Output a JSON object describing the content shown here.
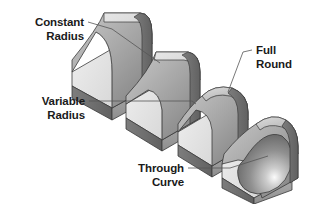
{
  "figure": {
    "background_color": "#ffffff",
    "line_color": "#555555",
    "text_color": "#1a1a1a",
    "shading": {
      "top_face": "#d9d9d9",
      "front_face": "#9c9c9c",
      "side_face": "#6f6f6f",
      "fillet_light": "#c4c4c4",
      "fillet_mid": "#a6a6a6",
      "fillet_dark": "#7c7c7c",
      "outline": "#3a3a3a",
      "highlight": "#f2f2f2"
    }
  },
  "callouts": [
    {
      "id": "constant-radius",
      "line1": "Constant",
      "line2": "Radius",
      "align": "right",
      "text_x": 84,
      "text_y1": 26,
      "text_y2": 40,
      "leader": "M 88 22 L 112 29 L 160 63"
    },
    {
      "id": "variable-radius",
      "line1": "Variable",
      "line2": "Radius",
      "align": "right",
      "text_x": 85,
      "text_y1": 105,
      "text_y2": 119,
      "leader": "M 89 101 L 192 101 L 196 104"
    },
    {
      "id": "full-round",
      "line1": "Full",
      "line2": "Round",
      "align": "left",
      "text_x": 256,
      "text_y1": 54,
      "text_y2": 68,
      "leader": "M 252 50 L 243 52 L 228 92"
    },
    {
      "id": "through-curve",
      "line1": "Through",
      "line2": "Curve",
      "align": "right",
      "text_x": 184,
      "text_y1": 172,
      "text_y2": 186,
      "leader": "M 188 168 L 230 168 L 268 156"
    }
  ],
  "shapes": [
    {
      "id": "shape-constant-radius",
      "label": "Constant Radius block",
      "description": "L-shaped bracket with a uniform concave fillet along the inside corner"
    },
    {
      "id": "shape-variable-radius",
      "label": "Variable Radius block",
      "description": "L-shaped bracket with a fillet whose radius tapers along its length"
    },
    {
      "id": "shape-full-round",
      "label": "Full Round block",
      "description": "L-shaped bracket whose upright is capped by a full rounded edge"
    },
    {
      "id": "shape-through-curve",
      "label": "Through Curve block",
      "description": "L-shaped bracket with a bulging convex blend swept through a curve"
    }
  ]
}
